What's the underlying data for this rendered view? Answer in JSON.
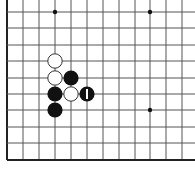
{
  "board": {
    "type": "go-board-fragment",
    "colors": {
      "background": "#ffffff",
      "grid_line": "#555555",
      "border_line": "#222222",
      "black_stone": "#111111",
      "white_stone": "#ffffff",
      "white_stone_outline": "#333333",
      "last_move_marker": "#ffffff",
      "star_point": "#111111"
    },
    "grid": {
      "x_lines": [
        7,
        23,
        39,
        55,
        71,
        87,
        103,
        119,
        135,
        150,
        166,
        182
      ],
      "y_lines": [
        12,
        28,
        45,
        61,
        78,
        94,
        110,
        127,
        143,
        160
      ],
      "left_edge_col": 0,
      "bottom_edge_row": 9
    },
    "star_points": [
      {
        "col": 3,
        "row": 0
      },
      {
        "col": 9,
        "row": 0
      },
      {
        "col": 9,
        "row": 6
      }
    ],
    "stones": [
      {
        "color": "white",
        "col": 3,
        "row": 3
      },
      {
        "color": "white",
        "col": 3,
        "row": 4
      },
      {
        "color": "black",
        "col": 4,
        "row": 4
      },
      {
        "color": "black",
        "col": 3,
        "row": 5
      },
      {
        "color": "white",
        "col": 4,
        "row": 5
      },
      {
        "color": "black",
        "col": 5,
        "row": 5,
        "last_move": true
      },
      {
        "color": "black",
        "col": 3,
        "row": 6
      }
    ]
  }
}
